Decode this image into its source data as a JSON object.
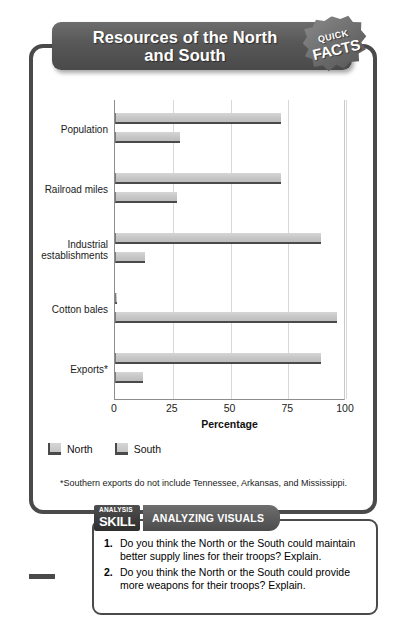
{
  "banner": {
    "title_line1": "Resources of the North",
    "title_line2": "and South",
    "badge_line1": "QUICK",
    "badge_line2": "FACTS"
  },
  "chart_data": {
    "type": "bar",
    "orientation": "horizontal",
    "title": "Resources of the North and South",
    "categories": [
      "Population",
      "Railroad miles",
      "Industrial establishments",
      "Cotton bales",
      "Exports*"
    ],
    "series": [
      {
        "name": "North",
        "values": [
          72,
          72,
          89,
          1,
          89
        ],
        "color": "#c6c6c6"
      },
      {
        "name": "South",
        "values": [
          28,
          27,
          13,
          96,
          12
        ],
        "color": "#c6c6c6"
      }
    ],
    "xlabel": "Percentage",
    "ylabel": "",
    "xlim": [
      0,
      100
    ],
    "xticks": [
      "0",
      "25",
      "50",
      "75",
      "100"
    ],
    "grid": true,
    "legend_position": "bottom-left"
  },
  "legend": {
    "items": [
      {
        "label": "North"
      },
      {
        "label": "South"
      }
    ]
  },
  "footnote": "*Southern exports do not include Tennessee, Arkansas, and Mississippi.",
  "analysis": {
    "tag_small": "ANALYSIS",
    "tag_large": "SKILL",
    "tag_banner": "ANALYZING VISUALS",
    "questions": [
      {
        "num": "1.",
        "text": "Do you think the North or the South could maintain better supply lines for their troops? Explain."
      },
      {
        "num": "2.",
        "text": "Do you think the North or the South could provide more weapons for their troops? Explain."
      }
    ]
  }
}
